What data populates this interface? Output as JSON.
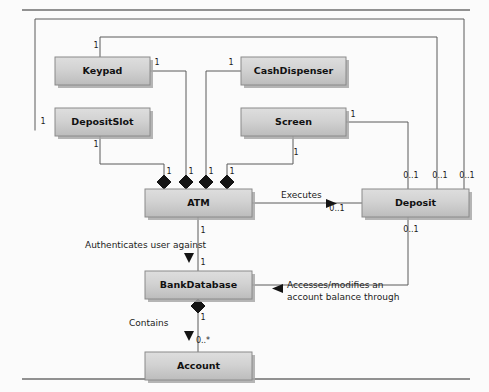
{
  "diagram": {
    "type": "uml-class-diagram",
    "colors": {
      "page_background": "#fbfbfb",
      "box_fill_top": "#d4d4d4",
      "box_fill_bottom": "#bdbdbd",
      "box_border": "#8a8a8a",
      "box_shadow": "#9a9a9a",
      "line": "#5a5a5a",
      "text": "#111111",
      "rule": "#6e6e6e"
    },
    "classes": [
      {
        "id": "keypad",
        "name": "Keypad",
        "x": 55,
        "y": 57,
        "w": 95,
        "h": 28
      },
      {
        "id": "cashdispenser",
        "name": "CashDispenser",
        "x": 241,
        "y": 57,
        "w": 105,
        "h": 28
      },
      {
        "id": "depositslot",
        "name": "DepositSlot",
        "x": 55,
        "y": 108,
        "w": 95,
        "h": 28
      },
      {
        "id": "screen",
        "name": "Screen",
        "x": 241,
        "y": 108,
        "w": 105,
        "h": 28
      },
      {
        "id": "atm",
        "name": "ATM",
        "x": 145,
        "y": 189,
        "w": 107,
        "h": 28
      },
      {
        "id": "deposit",
        "name": "Deposit",
        "x": 362,
        "y": 189,
        "w": 107,
        "h": 28
      },
      {
        "id": "bankdatabase",
        "name": "BankDatabase",
        "x": 145,
        "y": 271,
        "w": 107,
        "h": 28
      },
      {
        "id": "account",
        "name": "Account",
        "x": 145,
        "y": 352,
        "w": 107,
        "h": 28
      }
    ],
    "association_labels": [
      {
        "id": "executes",
        "text": "Executes",
        "x": 281,
        "y": 198,
        "anchor": "start"
      },
      {
        "id": "authenticates",
        "text": "Authenticates user against",
        "x": 85,
        "y": 248,
        "anchor": "start"
      },
      {
        "id": "accesses-line1",
        "text": "Accesses/modifies an",
        "x": 287,
        "y": 288,
        "anchor": "start"
      },
      {
        "id": "accesses-line2",
        "text": "account balance through",
        "x": 287,
        "y": 300,
        "anchor": "start"
      },
      {
        "id": "contains",
        "text": "Contains",
        "x": 129,
        "y": 326,
        "anchor": "start"
      }
    ],
    "multiplicities": [
      {
        "id": "m-keypad-top",
        "text": "1",
        "x": 96,
        "y": 48
      },
      {
        "id": "m-keypad-right",
        "text": "1",
        "x": 157,
        "y": 65
      },
      {
        "id": "m-cashdispenser-left",
        "text": "1",
        "x": 231,
        "y": 65
      },
      {
        "id": "m-depositslot-left",
        "text": "1",
        "x": 43,
        "y": 124
      },
      {
        "id": "m-depositslot-bottom",
        "text": "1",
        "x": 96,
        "y": 147
      },
      {
        "id": "m-screen-right",
        "text": "1",
        "x": 353,
        "y": 117
      },
      {
        "id": "m-screen-bottom",
        "text": "1",
        "x": 296,
        "y": 155
      },
      {
        "id": "m-atm-agg-1",
        "text": "1",
        "x": 169,
        "y": 174
      },
      {
        "id": "m-atm-agg-2",
        "text": "1",
        "x": 191,
        "y": 174
      },
      {
        "id": "m-atm-agg-3",
        "text": "1",
        "x": 211,
        "y": 174
      },
      {
        "id": "m-atm-agg-4",
        "text": "1",
        "x": 232,
        "y": 174
      },
      {
        "id": "m-deposit-top-1",
        "text": "0..1",
        "x": 411,
        "y": 178
      },
      {
        "id": "m-deposit-top-2",
        "text": "0..1",
        "x": 440,
        "y": 178
      },
      {
        "id": "m-deposit-top-3",
        "text": "0..1",
        "x": 467,
        "y": 178
      },
      {
        "id": "m-atm-executes",
        "text": "0..1",
        "x": 337,
        "y": 211
      },
      {
        "id": "m-deposit-bottom",
        "text": "0..1",
        "x": 411,
        "y": 232
      },
      {
        "id": "m-atm-bottom",
        "text": "1",
        "x": 203,
        "y": 233
      },
      {
        "id": "m-bankdb-top",
        "text": "1",
        "x": 203,
        "y": 265
      },
      {
        "id": "m-bankdb-bottom",
        "text": "1",
        "x": 203,
        "y": 320
      },
      {
        "id": "m-account-top",
        "text": "0..*",
        "x": 203,
        "y": 343
      }
    ]
  }
}
